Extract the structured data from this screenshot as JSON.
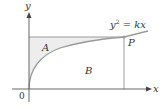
{
  "figure": {
    "axis_labels": {
      "x": "x",
      "y": "y",
      "origin": "0"
    },
    "curve": {
      "equation_lhs": "y",
      "equation_exp": "2",
      "equation_rhs": " = kx"
    },
    "regions": {
      "A": "A",
      "B": "B"
    },
    "point": {
      "label": "P"
    },
    "colors": {
      "axis": "#555555",
      "curve": "#9a9a9a",
      "rect": "#9a9a9a",
      "region_A_fill": "#ededed",
      "region_B_fill": "#ffffff",
      "text": "#333333"
    }
  }
}
